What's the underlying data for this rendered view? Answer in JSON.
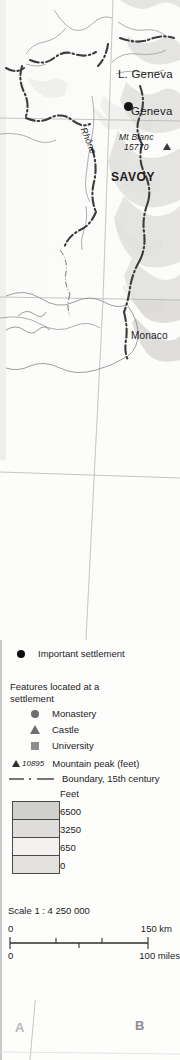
{
  "map": {
    "labels": [
      {
        "name": "lake-geneva-label",
        "text": "L. Geneva"
      },
      {
        "name": "geneva-label",
        "text": "Geneva"
      },
      {
        "name": "mont-blanc-label",
        "text": "Mt Blanc"
      },
      {
        "name": "mont-blanc-elevation",
        "text": "15770"
      },
      {
        "name": "savoy-label",
        "text": "SAVOY"
      },
      {
        "name": "monaco-label",
        "text": "Monaco"
      },
      {
        "name": "rhone-river-label",
        "text": "Rhône"
      }
    ],
    "lake_geneva": "L. Geneva",
    "geneva": "Geneva",
    "mont_blanc": "Mt Blanc",
    "mont_blanc_elev": "15770",
    "savoy": "SAVOY",
    "monaco": "Monaco",
    "rhone": "Rhône"
  },
  "legend": {
    "important_settlement": "Important settlement",
    "features_heading": "Features located at a settlement",
    "monastery": "Monastery",
    "castle": "Castle",
    "university": "University",
    "mountain_peak_value": "10895",
    "mountain_peak_label": "Mountain peak (feet)",
    "boundary_label": "Boundary, 15th century",
    "feet_header": "Feet",
    "elevation_values": [
      "6500",
      "3250",
      "650",
      "0"
    ],
    "elevation_colors": [
      "#d0d0cd",
      "#dedddb",
      "#f2f1ef",
      "#e2e1de"
    ]
  },
  "scale": {
    "title": "Scale 1 : 4 250 000",
    "km_start": "0",
    "km_end": "150 km",
    "miles_start": "0",
    "miles_end": "100 miles"
  },
  "grid": {
    "letter_a": "A",
    "letter_b": "B"
  }
}
